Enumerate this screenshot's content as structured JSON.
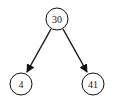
{
  "diagram": {
    "type": "binary-tree",
    "nodes": [
      {
        "id": "root",
        "label": "30",
        "cx": 57,
        "cy": 19,
        "r": 11
      },
      {
        "id": "left",
        "label": "4",
        "cx": 21,
        "cy": 84,
        "r": 11
      },
      {
        "id": "right",
        "label": "41",
        "cx": 93,
        "cy": 84,
        "r": 11
      }
    ],
    "edges": [
      {
        "from": "root",
        "to": "left"
      },
      {
        "from": "root",
        "to": "right"
      }
    ]
  }
}
